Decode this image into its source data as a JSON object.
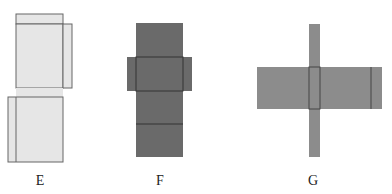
{
  "figures": [
    {
      "label": "E",
      "fill": "#e6e6e6",
      "label_x": 40
    },
    {
      "label": "F",
      "fill": "#6a6a6a",
      "label_x": 160
    },
    {
      "label": "G",
      "fill": "#8c8c8c",
      "label_x": 313
    }
  ],
  "colors": {
    "outline": "#555555",
    "inner_line": "#333333"
  }
}
